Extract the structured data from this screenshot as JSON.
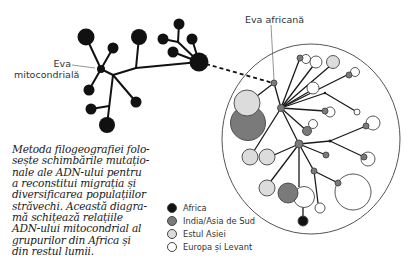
{
  "labels": {
    "eva_mitocondriala_line1": "Eva",
    "eva_mitocondriala_line2": "mitocondrială",
    "eva_africana": "Eva africană"
  },
  "caption": {
    "lines": [
      "Metoda filogeografiei folo-",
      "sește schimbările mutațio-",
      "nale ale ADN-ului pentru",
      "a reconstitui migrația și",
      "diversificarea populațiilor",
      "străvechi. Această diagra-",
      "mă schițează relațiile",
      "ADN-ului mitocondrial al",
      "grupurilor din Africa și",
      "din restul lumii."
    ]
  },
  "legend": {
    "items": [
      {
        "label": "Africa",
        "color": "#111111"
      },
      {
        "label": "India/Asia de Sud",
        "color": "#7a7a7a"
      },
      {
        "label": "Estul Asiei",
        "color": "#dcdcdc"
      },
      {
        "label": "Europa și Levant",
        "color": "#ffffff"
      }
    ]
  },
  "colors": {
    "africa": "#111111",
    "india": "#7a7a7a",
    "east_asia": "#dcdcdc",
    "europe": "#ffffff",
    "line": "#1a1a1a",
    "outline": "#555555"
  }
}
